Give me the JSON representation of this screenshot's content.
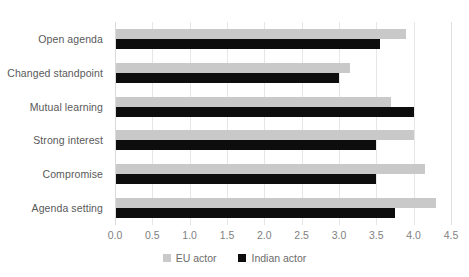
{
  "chart_data": {
    "type": "bar",
    "orientation": "horizontal",
    "title": "",
    "subtitle": "",
    "xlabel": "",
    "ylabel": "",
    "categories": [
      "Open agenda",
      "Changed standpoint",
      "Mutual learning",
      "Strong interest",
      "Compromise",
      "Agenda setting"
    ],
    "series": [
      {
        "name": "EU actor",
        "color": "#c9c9c9",
        "values": [
          3.9,
          3.15,
          3.7,
          4.0,
          4.15,
          4.3
        ]
      },
      {
        "name": "Indian actor",
        "color": "#0d0d0d",
        "values": [
          3.55,
          3.0,
          4.0,
          3.5,
          3.5,
          3.75
        ]
      }
    ],
    "xlim": [
      0.0,
      4.5
    ],
    "xticks": [
      "0.0",
      "0.5",
      "1.0",
      "1.5",
      "2.0",
      "2.5",
      "3.0",
      "3.5",
      "4.0",
      "4.5"
    ],
    "xtick_values": [
      0.0,
      0.5,
      1.0,
      1.5,
      2.0,
      2.5,
      3.0,
      3.5,
      4.0,
      4.5
    ],
    "grid": "vertical",
    "legend_position": "bottom",
    "legend": [
      {
        "label": "EU actor",
        "color": "#c9c9c9"
      },
      {
        "label": "Indian actor",
        "color": "#0d0d0d"
      }
    ]
  },
  "colors": {
    "eu_actor": "#c9c9c9",
    "indian_actor": "#0d0d0d",
    "gridline": "#e6e6e6",
    "axis": "#d9d9d9",
    "label_text": "#595959",
    "tick_text": "#7f7f7f",
    "legend_text": "#6b6b6b",
    "background": "#ffffff"
  }
}
